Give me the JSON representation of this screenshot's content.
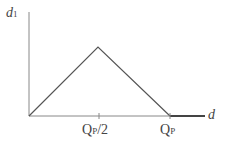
{
  "diagram": {
    "y_axis_label": "d",
    "y_axis_subscript": "1",
    "x_axis_label": "d",
    "tick_labels": [
      {
        "main": "Q",
        "sub": "P",
        "suffix": "/2"
      },
      {
        "main": "Q",
        "sub": "P",
        "suffix": ""
      }
    ],
    "shape": "triangle rising from origin to peak at Q_P/2 then falling to zero at Q_P, flat zero afterwards",
    "line_color": "#555555"
  }
}
